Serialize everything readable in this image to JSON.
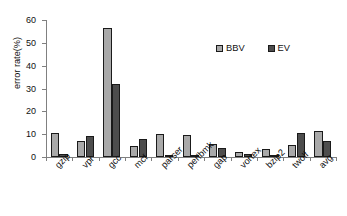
{
  "chart_data": {
    "type": "bar",
    "title": "",
    "xlabel": "",
    "ylabel": "error rate(%)",
    "ylim": [
      0,
      60
    ],
    "yticks": [
      0,
      10,
      20,
      30,
      40,
      50,
      60
    ],
    "grid": false,
    "legend_position": "top-right",
    "categories": [
      "gzip",
      "vpr",
      "gcc",
      "mcf",
      "parser",
      "perlbmk",
      "gap",
      "vortex",
      "bzip2",
      "twolf",
      "avg"
    ],
    "series": [
      {
        "name": "BBV",
        "color": "#a9a9a9",
        "values": [
          10.6,
          6.9,
          56.7,
          4.7,
          10.2,
          9.5,
          5.7,
          2.2,
          3.4,
          5.3,
          11.2
        ]
      },
      {
        "name": "EV",
        "color": "#4d4d4d",
        "values": [
          1.2,
          9.1,
          31.8,
          8.0,
          0.2,
          0.8,
          3.9,
          1.3,
          0.9,
          10.7,
          7.0
        ]
      }
    ]
  },
  "axis": {
    "y_title": "error rate(%)",
    "y_tick_labels": [
      "0",
      "10",
      "20",
      "30",
      "40",
      "50",
      "60"
    ]
  },
  "legend": {
    "items": [
      {
        "label": "BBV",
        "color": "#a9a9a9"
      },
      {
        "label": "EV",
        "color": "#4d4d4d"
      }
    ]
  }
}
